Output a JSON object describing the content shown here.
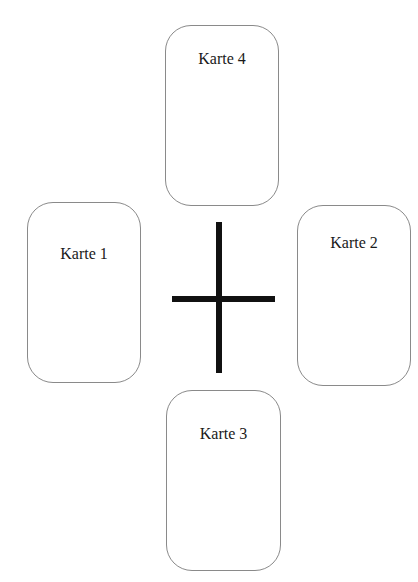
{
  "diagram": {
    "cards": [
      {
        "id": 1,
        "label": "Karte 1",
        "position": "left"
      },
      {
        "id": 2,
        "label": "Karte 2",
        "position": "right"
      },
      {
        "id": 3,
        "label": "Karte 3",
        "position": "bottom"
      },
      {
        "id": 4,
        "label": "Karte 4",
        "position": "top"
      }
    ],
    "center_symbol": "cross",
    "colors": {
      "card_border": "#8a8a8a",
      "cross": "#111111",
      "background": "#ffffff"
    }
  }
}
